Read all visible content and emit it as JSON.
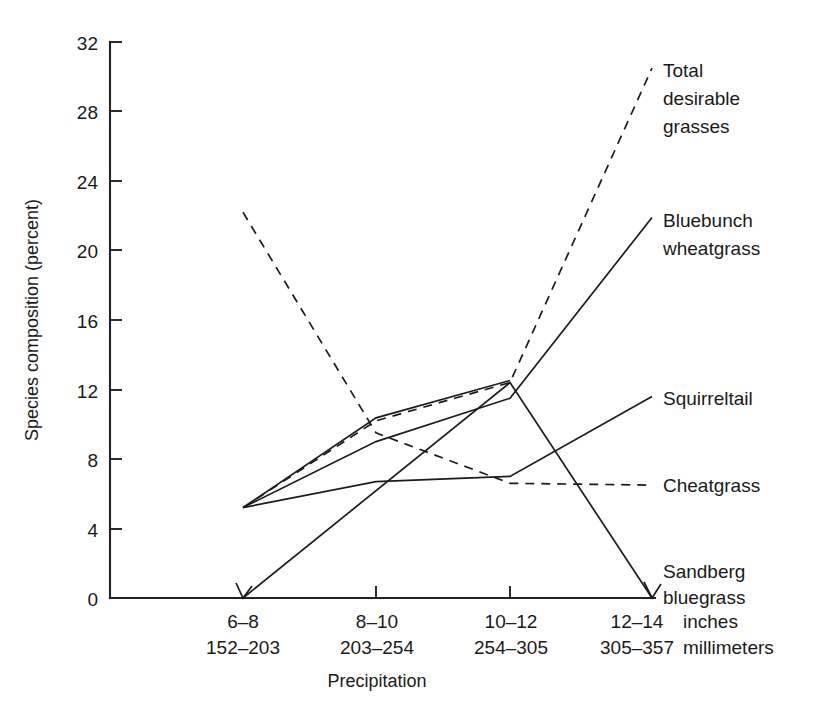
{
  "chart_data": {
    "type": "line",
    "title": "",
    "xlabel": "Precipitation",
    "ylabel": "Species composition (percent)",
    "ylim": [
      0,
      32
    ],
    "yticks": [
      0,
      4,
      8,
      12,
      16,
      20,
      24,
      28,
      32
    ],
    "ytick_labels": [
      "0",
      "4",
      "8",
      "12",
      "16",
      "20",
      "24",
      "28",
      "32"
    ],
    "grid": false,
    "legend_position": "right-inline-labels",
    "categories": [
      "6–08",
      "8–10",
      "10–12",
      "12–14"
    ],
    "x_tick_labels_inches": [
      "6–8",
      "8–10",
      "10–12",
      "12–14"
    ],
    "x_tick_labels_millimeters": [
      "152–203",
      "203–254",
      "254–305",
      "305–357"
    ],
    "x_unit_inches": "inches",
    "x_unit_millimeters": "millimeters",
    "series": [
      {
        "name": "Total desirable grasses",
        "style": "dashed",
        "values": [
          5.2,
          10.2,
          12.4,
          30.5
        ]
      },
      {
        "name": "Bluebunch wheatgrass",
        "style": "solid",
        "values": [
          5.2,
          9.0,
          11.5,
          21.9
        ]
      },
      {
        "name": "Squirreltail",
        "style": "solid",
        "values": [
          5.2,
          6.7,
          7.0,
          11.6
        ]
      },
      {
        "name": "Cheatgrass",
        "style": "dashed",
        "values": [
          22.2,
          9.5,
          6.6,
          6.5
        ]
      },
      {
        "name": "Sandberg bluegrass",
        "style": "solid",
        "values": [
          0.0,
          5.2,
          12.4,
          0.0
        ]
      }
    ]
  },
  "axes": {
    "y_axis_title": "Species composition (percent)",
    "x_axis_title": "Precipitation",
    "y_tick_labels": [
      "32",
      "28",
      "24",
      "20",
      "16",
      "12",
      "8",
      "4",
      "0"
    ],
    "x_columns": [
      {
        "inches": "6–8",
        "millimeters": "152–203"
      },
      {
        "inches": "8–10",
        "millimeters": "203–254"
      },
      {
        "inches": "10–12",
        "millimeters": "254–305"
      },
      {
        "inches": "12–14",
        "millimeters": "305–357"
      }
    ],
    "unit_inches": "inches",
    "unit_millimeters": "millimeters"
  },
  "series_labels": {
    "total_desirable_grasses_line1": "Total",
    "total_desirable_grasses_line2": "desirable",
    "total_desirable_grasses_line3": "grasses",
    "bluebunch_line1": "Bluebunch",
    "bluebunch_line2": "wheatgrass",
    "squirreltail": "Squirreltail",
    "cheatgrass": "Cheatgrass",
    "sandberg_line1": "Sandberg",
    "sandberg_line2": "bluegrass"
  },
  "colors": {
    "line": "#1c1c1c",
    "axis": "#222222",
    "text": "#1a1a1a",
    "background": "#ffffff"
  }
}
